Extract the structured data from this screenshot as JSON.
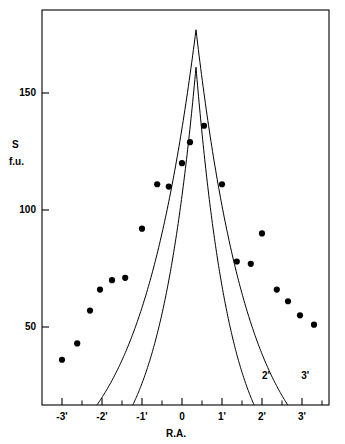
{
  "chart_data": {
    "type": "scatter",
    "title": "",
    "subtitle": "",
    "xlabel": "R.A.",
    "ylabel_line1": "S",
    "ylabel_line2": "f.u.",
    "xlim": [
      -3.4,
      3.7
    ],
    "ylim": [
      0,
      190
    ],
    "grid": false,
    "legend": "none",
    "x_ticks": [
      -3,
      -2,
      -1,
      0,
      1,
      2,
      3
    ],
    "x_tick_labels": [
      "-3'",
      "-2'",
      "-1'",
      "0",
      "1'",
      "2'",
      "3'"
    ],
    "x_minor_ticks": [
      -2.5,
      -1.5,
      -0.5,
      0.5,
      1.5,
      2.5,
      3.5
    ],
    "y_ticks": [
      50,
      100,
      150
    ],
    "y_tick_labels": [
      "50",
      "100",
      "150"
    ],
    "points": {
      "name": "observed flux density",
      "marker": "filled-circle",
      "color": "#000000",
      "x": [
        -3.0,
        -2.62,
        -2.3,
        -2.05,
        -1.75,
        -1.42,
        -1.0,
        -0.62,
        -0.33,
        0.0,
        0.2,
        0.55,
        1.0,
        1.37,
        1.72,
        2.0,
        2.37,
        2.65,
        2.95,
        3.3
      ],
      "y": [
        36,
        43,
        57,
        66,
        70,
        71,
        92,
        111,
        110,
        120,
        129,
        136,
        111,
        78,
        77,
        90,
        66,
        61,
        55,
        51
      ]
    },
    "series": [
      {
        "name": "2'",
        "label": "2'",
        "color": "#000000",
        "style": "solid",
        "peak_x": 0.35,
        "peak_y": 161,
        "x_left_intercept": -1.88,
        "x_right_intercept": 2.4,
        "label_x": 2.15,
        "label_y": 29
      },
      {
        "name": "3'",
        "label": "3'",
        "color": "#000000",
        "style": "solid",
        "peak_x": 0.35,
        "peak_y": 177,
        "x_left_intercept": -3.05,
        "x_right_intercept": 3.5,
        "label_x": 3.13,
        "label_y": 29
      }
    ],
    "frame": {
      "color": "#000000",
      "box": true
    }
  }
}
